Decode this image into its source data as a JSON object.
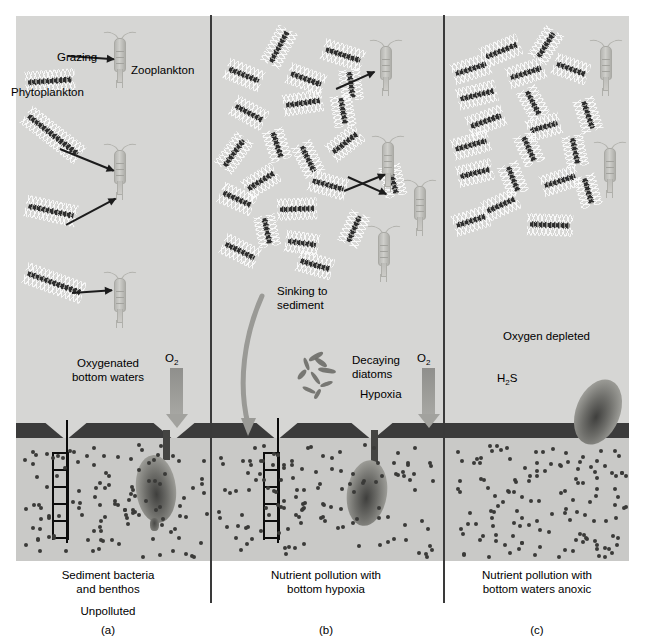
{
  "figure": {
    "background_color": "#d6d6d4",
    "sediment_color": "#c9c9c7",
    "sediment_surface_color": "#3b3b3b",
    "diatom_color": "#2e2e2e",
    "copepod_color": "#bdbdb9",
    "arrow_color": "#1c1c1c",
    "o2_arrow_color": "#a2a29e"
  },
  "panels": [
    {
      "id": "a",
      "letter": "(a)",
      "status": "Unpolluted",
      "caption": "Sediment bacteria\nand benthos",
      "caption_line1": "Sediment bacteria",
      "caption_line2": "and benthos",
      "water_label_line1": "Oxygenated",
      "water_label_line2": "bottom waters",
      "o2_label": "O",
      "o2_sub": "2",
      "labels": {
        "grazing": "Grazing",
        "zooplankton": "Zooplankton",
        "phytoplankton": "Phytoplankton"
      },
      "counts": {
        "diatoms": 4,
        "copepods": 3,
        "grazing_arrows": 4,
        "burrows": 1,
        "ladders": 1,
        "benthos": 1
      }
    },
    {
      "id": "b",
      "letter": "(b)",
      "status": "Nutrient pollution with bottom hypoxia",
      "caption_line1": "Nutrient pollution with",
      "caption_line2": "bottom hypoxia",
      "sinking_line1": "Sinking to",
      "sinking_line2": "sediment",
      "decaying_line1": "Decaying",
      "decaying_line2": "diatoms",
      "hypoxia_label": "Hypoxia",
      "o2_label": "O",
      "o2_sub": "2",
      "counts": {
        "diatoms": 22,
        "copepods": 4,
        "grazing_arrows": 3,
        "burrows": 1,
        "ladders": 1,
        "benthos": 1
      }
    },
    {
      "id": "c",
      "letter": "(c)",
      "status": "Nutrient pollution with bottom waters anoxic",
      "caption_line1": "Nutrient pollution with",
      "caption_line2": "bottom waters anoxic",
      "oxygen_label": "Oxygen depleted",
      "h2s_label": "H",
      "h2s_sub": "2",
      "h2s_tail": "S",
      "counts": {
        "diatoms": 20,
        "copepods": 2,
        "grazing_arrows": 0,
        "burrows": 0,
        "ladders": 0,
        "benthos": 1
      }
    }
  ]
}
